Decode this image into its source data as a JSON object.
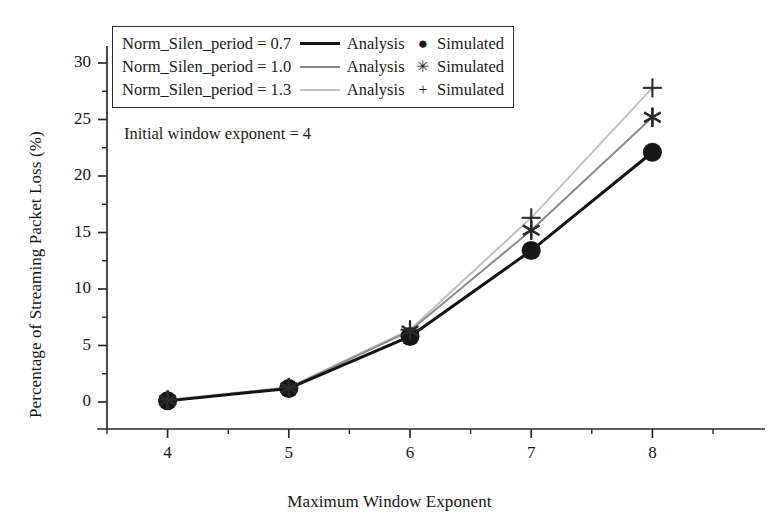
{
  "chart_data": {
    "type": "line",
    "title": "",
    "xlabel": "Maximum Window Exponent",
    "ylabel": "Percentage of Streaming Packet Loss (%)",
    "x": [
      4,
      5,
      6,
      7,
      8
    ],
    "xlim": [
      3.5,
      8.5
    ],
    "ylim": [
      -1.5,
      31.5
    ],
    "xticks": [
      "4",
      "5",
      "6",
      "7",
      "8"
    ],
    "yticks": [
      "0",
      "5",
      "10",
      "15",
      "20",
      "25",
      "30"
    ],
    "xtick_minor_step": 0.5,
    "ytick_minor_step": 2.5,
    "grid": false,
    "legend_position": "top-left",
    "annotation": "Initial window exponent = 4",
    "series": [
      {
        "name": "Norm_Silen_period = 0.7",
        "line_label": "Analysis",
        "marker_label": "Simulated",
        "marker": "circle",
        "marker_glyph": "●",
        "color": "#141414",
        "line_width": 3.0,
        "values": [
          0.1,
          1.2,
          5.8,
          13.4,
          22.1
        ]
      },
      {
        "name": "Norm_Silen_period = 1.0",
        "line_label": "Analysis",
        "marker_label": "Simulated",
        "marker": "asterisk",
        "marker_glyph": "✳",
        "color": "#8a8a8a",
        "line_width": 2.0,
        "values": [
          0.15,
          1.25,
          6.3,
          15.2,
          25.2
        ]
      },
      {
        "name": "Norm_Silen_period = 1.3",
        "line_label": "Analysis",
        "marker_label": "Simulated",
        "marker": "plus",
        "marker_glyph": "+",
        "color": "#c0c0c0",
        "line_width": 2.0,
        "values": [
          0.2,
          1.3,
          6.4,
          16.3,
          27.8
        ]
      }
    ]
  },
  "axis": {
    "line_color": "#2a2a2a"
  }
}
